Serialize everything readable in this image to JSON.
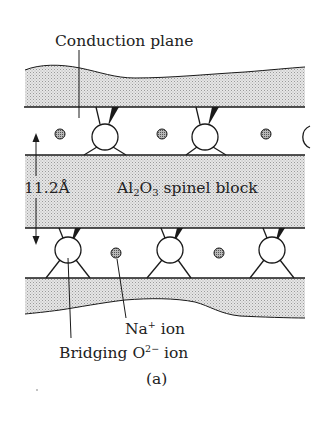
{
  "figure": {
    "panel_label": "(a)",
    "labels": {
      "conduction_plane": "Conduction plane",
      "spacing": "11.2Å",
      "spinel_block": {
        "prefix": "Al",
        "sub1": "2",
        "mid": "O",
        "sub2": "3",
        "suffix": " spinel block"
      },
      "na_ion": {
        "base": "Na",
        "sup": "+",
        "suffix": " ion"
      },
      "bridging_ion": {
        "base": "Bridging O",
        "sup": "2−",
        "suffix": " ion"
      }
    },
    "colors": {
      "line": "#1a1a1a",
      "band_fill": "#dcdcdc",
      "ion_fill": "#8c8c8c",
      "text": "#222222",
      "background": "#ffffff"
    },
    "structure": {
      "top_conduction_row": {
        "na_ions": [
          60,
          162,
          266
        ],
        "bridging_o": [
          105,
          205,
          305
        ]
      },
      "bottom_conduction_row": {
        "na_ions": [
          116,
          219
        ],
        "bridging_o": [
          68,
          170,
          272
        ]
      }
    }
  }
}
